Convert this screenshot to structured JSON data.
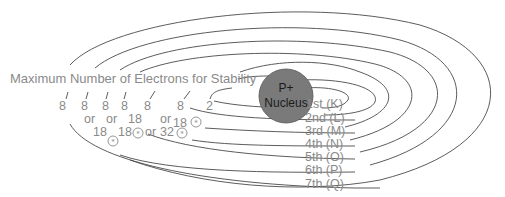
{
  "title": "Maximum Number of Electrons for Stability",
  "nucleus": {
    "line1": "P+",
    "line2": "Nucleus",
    "fill_color": "#7a7a7a"
  },
  "shells": [
    {
      "label": "1st (K)",
      "max": "2"
    },
    {
      "label": "2nd (L)",
      "max": "8"
    },
    {
      "label": "3rd (M)",
      "max": "8 or 18",
      "note_icon": "asterisk-circle"
    },
    {
      "label": "4th (N)",
      "max": "8 or 18 or 32",
      "note_icon": "asterisk-circle"
    },
    {
      "label": "5th (O)",
      "max": "8 or 18",
      "note_icon": "asterisk-circle"
    },
    {
      "label": "6th (P)",
      "max": "8 or 18",
      "note_icon": "asterisk-circle"
    },
    {
      "label": "7th (Q)",
      "max": "8"
    }
  ],
  "counts": {
    "s7": "8",
    "s6a": "8",
    "s6or": "or",
    "s6b": "18",
    "s5a": "8",
    "s5or": "or",
    "s5b": "18",
    "s4a": "8",
    "s4b": "18",
    "s4or": "or",
    "s3a": "8",
    "s3or": "or",
    "s3b": "32",
    "s2a": "8",
    "s2b": "18",
    "s1": "2"
  },
  "star_glyph": "*"
}
